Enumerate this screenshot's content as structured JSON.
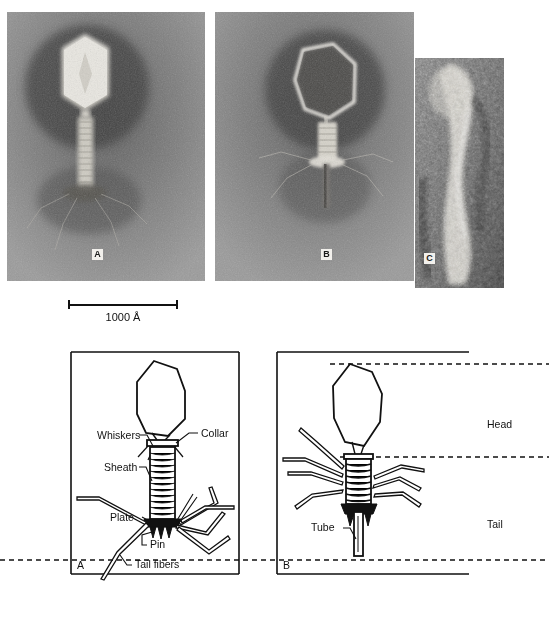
{
  "figure": {
    "background_color": "#ffffff"
  },
  "micrographs": {
    "panels": [
      {
        "tag": "A",
        "caption": "Extended-tail bacteriophage, negatively stained",
        "tag_color": "#1a1a1a",
        "tag_background": "#f2f0ec"
      },
      {
        "tag": "B",
        "caption": "Contracted-sheath bacteriophage with empty head",
        "tag_color": "#1a1a1a",
        "tag_background": "#f2f0ec"
      },
      {
        "tag": "C",
        "caption": "High magnification detail of phage tail",
        "tag_color": "#1a1a1a",
        "tag_background": "#f2f0ec"
      }
    ]
  },
  "scale_bar": {
    "label": "1000 Å",
    "value": 1000,
    "unit": "Å"
  },
  "diagrams": {
    "panel_a": {
      "tag": "A",
      "labels": [
        {
          "name": "whiskers",
          "text": "Whiskers"
        },
        {
          "name": "collar",
          "text": "Collar"
        },
        {
          "name": "sheath",
          "text": "Sheath"
        },
        {
          "name": "plate",
          "text": "Plate"
        },
        {
          "name": "pin",
          "text": "Pin"
        },
        {
          "name": "tail-fibers",
          "text": "Tail fibers"
        }
      ]
    },
    "panel_b": {
      "tag": "B",
      "labels": [
        {
          "name": "tube",
          "text": "Tube"
        }
      ],
      "zones": [
        {
          "name": "head",
          "text": "Head"
        },
        {
          "name": "tail",
          "text": "Tail"
        }
      ]
    }
  },
  "colors": {
    "ink": "#111111",
    "paper": "#ffffff",
    "micrograph_mid": "#8d8d8d"
  }
}
